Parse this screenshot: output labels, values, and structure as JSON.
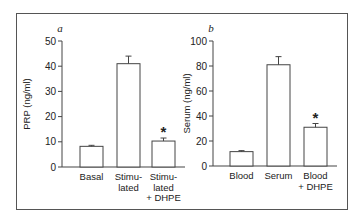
{
  "chart_data": [
    {
      "type": "bar",
      "panel_label": "a",
      "title": "",
      "xlabel": "",
      "ylabel": "PRP (ng/ml)",
      "ylim": [
        0,
        50
      ],
      "yticks": [
        0,
        10,
        20,
        30,
        40,
        50
      ],
      "categories": [
        "Basal",
        "Stimulated",
        "Stimulated + DHPE"
      ],
      "category_lines": [
        [
          "Basal"
        ],
        [
          "Stimu-",
          "lated"
        ],
        [
          "Stimu-",
          "lated",
          "+ DHPE"
        ]
      ],
      "values": [
        8.2,
        41.0,
        10.3
      ],
      "error": [
        0.4,
        3.0,
        1.2
      ],
      "annotations": [
        {
          "category": "Stimulated + DHPE",
          "text": "*"
        }
      ],
      "grid": false,
      "legend": null
    },
    {
      "type": "bar",
      "panel_label": "b",
      "title": "",
      "xlabel": "",
      "ylabel": "Serum (ng/ml)",
      "ylim": [
        0,
        100
      ],
      "yticks": [
        0,
        20,
        40,
        60,
        80,
        100
      ],
      "categories": [
        "Blood",
        "Serum",
        "Blood + DHPE"
      ],
      "category_lines": [
        [
          "Blood"
        ],
        [
          "Serum"
        ],
        [
          "Blood",
          "+ DHPE"
        ]
      ],
      "values": [
        11.5,
        81.0,
        31.0
      ],
      "error": [
        0.8,
        6.5,
        3.0
      ],
      "annotations": [
        {
          "category": "Blood + DHPE",
          "text": "*"
        }
      ],
      "grid": false,
      "legend": null
    }
  ]
}
